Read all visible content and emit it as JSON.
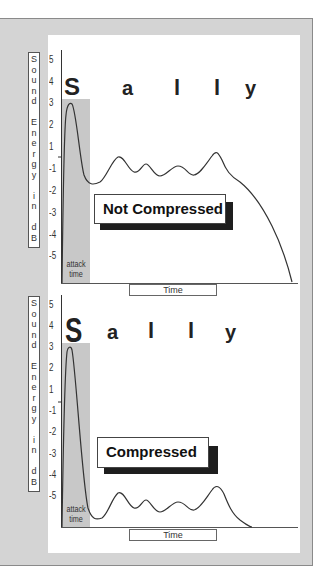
{
  "figure": {
    "ylabel_letters": [
      "S",
      "o",
      "u",
      "n",
      "d",
      "",
      "E",
      "n",
      "e",
      "r",
      "g",
      "y",
      "",
      "i",
      "n",
      "",
      "d",
      "B"
    ],
    "ylabel": "Sound Energy in dB",
    "yticks": [
      "5",
      "4",
      "3",
      "2",
      "1",
      "-1",
      "-2",
      "-3",
      "-4",
      "-5"
    ],
    "syllables": [
      "S",
      "a",
      "l",
      "l",
      "y"
    ],
    "attack_label_line1": "attack",
    "attack_label_line2": "time",
    "xlabel": "Time"
  },
  "charts": [
    {
      "id": "top",
      "status_label": "Not Compressed"
    },
    {
      "id": "bottom",
      "status_label": "Compressed"
    }
  ],
  "colors": {
    "panel": "#d4d4d4",
    "attack_shade": "#c8c8c8",
    "label_shadow": "#1e1e1e",
    "curve": "#333333"
  }
}
